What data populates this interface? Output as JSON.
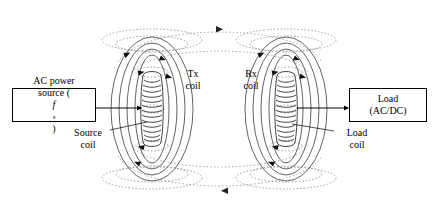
{
  "figure": {
    "type": "schematic-diagram"
  },
  "blocks": {
    "source": {
      "line1": "AC power",
      "line2_prefix": "source (",
      "line2_var": "f",
      "line2_sub": "s",
      "line2_suffix": ")",
      "name": "ac-power-source-block"
    },
    "load": {
      "line1": "Load",
      "line2": "(AC/DC)",
      "name": "load-block"
    }
  },
  "labels": {
    "tx": {
      "line1": "Tx",
      "line2": "coil"
    },
    "rx": {
      "line1": "Rx",
      "line2": "coil"
    },
    "source_coil": {
      "line1": "Source",
      "line2": "coil"
    },
    "load_coil": {
      "line1": "Load",
      "line2": "coil"
    }
  },
  "colors": {
    "stroke": "#000000",
    "field_line": "#3a3a3a",
    "dashed_loop": "#7a7a7a",
    "background": "#ffffff"
  },
  "geometry": {
    "tx_center_x": 152,
    "rx_center_x": 286,
    "center_y": 109,
    "coil_half_height": 45,
    "coil_half_width": 9
  }
}
